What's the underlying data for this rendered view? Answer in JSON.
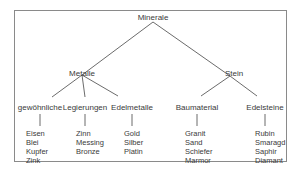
{
  "root": {
    "label": "Minerale"
  },
  "level1": [
    {
      "label": "Metalle"
    },
    {
      "label": "Stein"
    }
  ],
  "level2": [
    {
      "label": "gewöhnliche",
      "parent": "Metalle",
      "items": [
        "Eisen",
        "Blei",
        "Kupfer",
        "Zink"
      ]
    },
    {
      "label": "Legierungen",
      "parent": "Metalle",
      "items": [
        "Zinn",
        "Messing",
        "Bronze"
      ]
    },
    {
      "label": "Edelmetalle",
      "parent": "Metalle",
      "items": [
        "Gold",
        "Silber",
        "Platin"
      ]
    },
    {
      "label": "Baumaterial",
      "parent": "Stein",
      "items": [
        "Granit",
        "Sand",
        "Schiefer",
        "Marmor"
      ]
    },
    {
      "label": "Edelsteine",
      "parent": "Stein",
      "items": [
        "Rubin",
        "Smaragd",
        "Saphir",
        "Diamant"
      ]
    }
  ],
  "colors": {
    "line": "#5a5a5a",
    "frame": "#8a8a8a",
    "text": "#3a3a3a"
  }
}
